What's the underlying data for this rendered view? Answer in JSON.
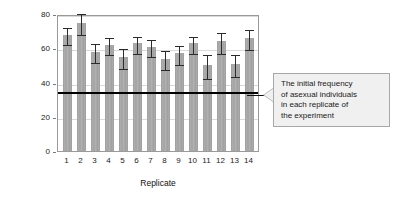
{
  "chart_data": {
    "type": "bar",
    "title": "",
    "xlabel": "Replicate",
    "ylabel": "Percentage asexual after experiment",
    "categories": [
      "1",
      "2",
      "3",
      "4",
      "5",
      "6",
      "7",
      "8",
      "9",
      "10",
      "11",
      "12",
      "13",
      "14"
    ],
    "values": [
      68,
      75,
      58,
      62,
      55,
      63,
      61,
      54,
      57,
      63,
      50,
      64,
      51,
      66
    ],
    "errors": [
      5,
      6,
      5.5,
      5,
      6,
      5,
      5,
      5.5,
      5.5,
      5,
      7,
      6,
      6.5,
      6
    ],
    "ylim": [
      0,
      80
    ],
    "yticks": [
      0,
      20,
      40,
      60,
      80
    ],
    "ytick_labels": [
      "0",
      "20",
      "40",
      "60",
      "80"
    ],
    "grid": true,
    "legend": "none",
    "threshold": {
      "value": 35,
      "label": "The initial frequency of asexual individuals in each replicate of the experiment"
    },
    "colors": {
      "bar": "#a6a6a6",
      "error": "#2b2b2b",
      "threshold": "#000000",
      "grid": "#d9d9d9",
      "frame": "#9a9a9a",
      "callout_bg": "#f0f0f0",
      "callout_border": "#a8a8a8",
      "text": "#1a1a1a"
    }
  },
  "axis": {
    "y_title_line1": "Percentage asexual after",
    "y_title_line2": "experiment",
    "x_title": "Replicate"
  },
  "callout": {
    "line1": "The initial frequency",
    "line2": "of asexual individuals",
    "line3": "in each replicate of",
    "line4": "the experiment"
  }
}
